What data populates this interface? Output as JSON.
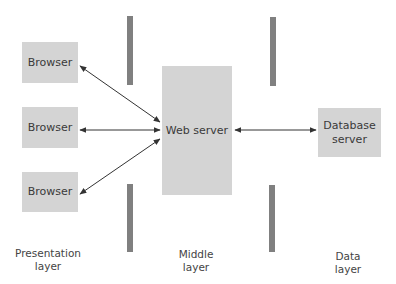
{
  "diagram": {
    "colors": {
      "box_fill": "#d4d4d4",
      "separator_bar": "#808080",
      "arrow": "#333333",
      "text": "#3a3a3a"
    },
    "nodes": {
      "browser_1": {
        "label": "Browser"
      },
      "browser_2": {
        "label": "Browser"
      },
      "browser_3": {
        "label": "Browser"
      },
      "web_server": {
        "label": "Web server"
      },
      "database_server": {
        "label": "Database server",
        "line1": "Database",
        "line2": "server"
      }
    },
    "edges": [
      {
        "from": "browser_1",
        "to": "web_server",
        "type": "bidirectional"
      },
      {
        "from": "browser_2",
        "to": "web_server",
        "type": "bidirectional"
      },
      {
        "from": "browser_3",
        "to": "web_server",
        "type": "bidirectional"
      },
      {
        "from": "web_server",
        "to": "database_server",
        "type": "bidirectional"
      }
    ],
    "layers": {
      "presentation": {
        "line1": "Presentation",
        "line2": "layer"
      },
      "middle": {
        "line1": "Middle",
        "line2": "layer"
      },
      "data": {
        "line1": "Data",
        "line2": "layer"
      }
    }
  }
}
